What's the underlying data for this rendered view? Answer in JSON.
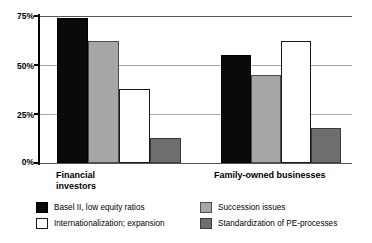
{
  "chart_data": {
    "type": "bar",
    "title": "",
    "subtitle": "",
    "xlabel": "",
    "ylabel": "",
    "categories": [
      "Financial\ninvestors",
      "Family-owned businesses"
    ],
    "category_labels_flat": [
      "Financial investors",
      "Family-owned businesses"
    ],
    "series": [
      {
        "name": "Basel II, low equity ratios",
        "color": "#0a0a0a",
        "values": [
          74,
          55
        ]
      },
      {
        "name": "Succession issues",
        "color": "#a6a6a6",
        "values": [
          62,
          45
        ]
      },
      {
        "name": "Internationalization; expansion",
        "color": "#ffffff",
        "values": [
          38,
          62
        ]
      },
      {
        "name": "Standardization of PE-processes",
        "color": "#6e6e6e",
        "values": [
          13,
          18
        ]
      }
    ],
    "ylim": [
      0,
      75
    ],
    "yticks": [
      0,
      25,
      50,
      75
    ],
    "ytick_labels": [
      "0%",
      "25%",
      "50%",
      "75%"
    ],
    "grid": true,
    "legend_position": "bottom",
    "legend_order": [
      "Basel II, low equity ratios",
      "Succession issues",
      "Internationalization; expansion",
      "Standardization of PE-processes"
    ]
  },
  "axis": {
    "tick_0": "0%",
    "tick_1": "25%",
    "tick_2": "50%",
    "tick_3": "75%"
  },
  "legend": {
    "items": [
      {
        "label": "Basel II, low equity ratios",
        "swatch": "black-swatch"
      },
      {
        "label": "Internationalization; expansion",
        "swatch": "white-swatch"
      },
      {
        "label": "Succession issues",
        "swatch": "light-gray-swatch"
      },
      {
        "label": "Standardization of PE-processes",
        "swatch": "dark-gray-swatch"
      }
    ]
  },
  "colors": {
    "black": "#0a0a0a",
    "light_gray": "#a6a6a6",
    "white": "#ffffff",
    "dark_gray": "#6e6e6e",
    "gridline": "#a8a8a8",
    "axis": "#000000",
    "background": "#ffffff"
  }
}
